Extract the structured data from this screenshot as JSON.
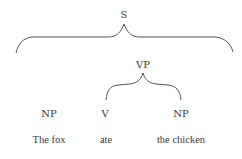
{
  "diagram": {
    "type": "syntax-tree",
    "root": {
      "label": "S",
      "x": 124,
      "y": 18
    },
    "nodes": [
      {
        "id": "np1",
        "label": "NP",
        "x": 49,
        "y": 117
      },
      {
        "id": "vp",
        "label": "VP",
        "x": 143,
        "y": 68
      },
      {
        "id": "v",
        "label": "V",
        "x": 105,
        "y": 117
      },
      {
        "id": "np2",
        "label": "NP",
        "x": 181,
        "y": 117
      }
    ],
    "words": [
      {
        "id": "w1",
        "text": "The fox",
        "x": 49,
        "y": 143
      },
      {
        "id": "w2",
        "text": "ate",
        "x": 106,
        "y": 143
      },
      {
        "id": "w3",
        "text": "the chicken",
        "x": 181,
        "y": 143
      }
    ],
    "edges": [
      {
        "from": "S",
        "to": [
          "NP",
          "NP"
        ],
        "shape": "brace"
      },
      {
        "from": "VP",
        "to": [
          "V",
          "NP"
        ],
        "shape": "brace"
      }
    ],
    "colors": {
      "text": "#3a3a3a",
      "line": "#555555",
      "background": "#ffffff"
    }
  }
}
